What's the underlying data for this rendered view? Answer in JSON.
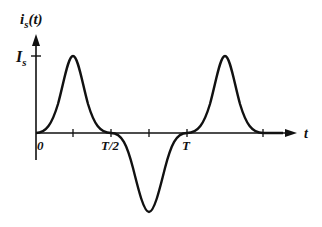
{
  "diagram": {
    "y_axis_label": "i",
    "y_axis_label_sub": "s",
    "y_axis_label_arg": "(t)",
    "y_level_label": "I",
    "y_level_label_sub": "s",
    "x_axis_label": "t",
    "tick_labels": [
      "0",
      "T/2",
      "T"
    ],
    "colors": {
      "stroke": "#111111",
      "background": "#ffffff"
    }
  }
}
